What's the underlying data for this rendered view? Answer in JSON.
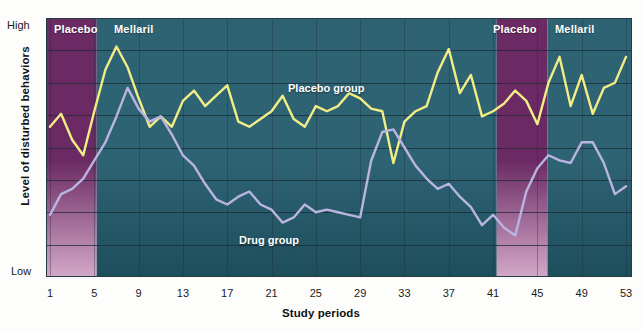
{
  "axes": {
    "y_title": "Level of disturbed behaviors",
    "y_high": "High",
    "y_low": "Low",
    "x_title": "Study periods"
  },
  "bands": [
    {
      "name": "Placebo",
      "label": "Placebo",
      "start": 1,
      "end": 5.5,
      "color": "#6b2a63"
    },
    {
      "name": "Mellaril",
      "label": "Mellaril",
      "start": 5.5,
      "end": 41,
      "color": "#2e6374"
    },
    {
      "name": "Placebo",
      "label": "Placebo",
      "start": 41,
      "end": 45.5,
      "color": "#6b2a63"
    },
    {
      "name": "Mellaril",
      "label": "Mellaril",
      "start": 45.5,
      "end": 53,
      "color": "#2e6374"
    }
  ],
  "series_labels": {
    "placebo": "Placebo group",
    "drug": "Drug group"
  },
  "colors": {
    "placebo_line": "#f2ed85",
    "drug_line": "#b9b4e0",
    "placebo_band": "#6b2a63",
    "placebo_band_bottom": "#d3a8c9",
    "mellaril_band": "#2e6374",
    "mellaril_band_bottom": "#1d4e5c",
    "gridline": "#1b2b33",
    "text": "#1a1a1a"
  },
  "xticks": [
    1,
    5,
    9,
    13,
    17,
    21,
    25,
    29,
    33,
    37,
    41,
    45,
    49,
    53
  ],
  "chart_data": {
    "type": "line",
    "title": "",
    "xlabel": "Study periods",
    "ylabel": "Level of disturbed behaviors",
    "ylim": [
      0,
      100
    ],
    "ytick_labels": [
      "Low",
      "High"
    ],
    "xlim": [
      1,
      53
    ],
    "grid": "horizontal-and-vertical",
    "legend": "inline-annotation",
    "gridlines_y": 7,
    "x": [
      1,
      2,
      3,
      4,
      5,
      6,
      7,
      8,
      9,
      10,
      11,
      12,
      13,
      14,
      15,
      16,
      17,
      18,
      19,
      20,
      21,
      22,
      23,
      24,
      25,
      26,
      27,
      28,
      29,
      30,
      31,
      32,
      33,
      34,
      35,
      36,
      37,
      38,
      39,
      40,
      41,
      42,
      43,
      44,
      45,
      46,
      47,
      48,
      49,
      50,
      51,
      52,
      53
    ],
    "series": [
      {
        "name": "Placebo group",
        "color": "#f2ed85",
        "values": [
          58,
          63,
          53,
          47,
          64,
          80,
          89,
          81,
          69,
          58,
          62,
          58,
          68,
          72,
          66,
          70,
          74,
          60,
          58,
          61,
          64,
          70,
          61,
          58,
          66,
          64,
          66,
          71,
          69,
          65,
          64,
          44,
          60,
          64,
          66,
          79,
          88,
          71,
          78,
          62,
          64,
          67,
          72,
          68,
          59,
          75,
          85,
          66,
          78,
          63,
          73,
          75,
          85
        ],
        "annotation": "Placebo group"
      },
      {
        "name": "Drug group",
        "color": "#b9b4e0",
        "values": [
          24,
          32,
          34,
          38,
          45,
          52,
          62,
          73,
          65,
          60,
          62,
          55,
          47,
          43,
          36,
          30,
          28,
          31,
          33,
          28,
          26,
          21,
          23,
          28,
          25,
          26,
          25,
          24,
          23,
          45,
          56,
          57,
          50,
          43,
          38,
          34,
          36,
          31,
          27,
          20,
          24,
          19,
          16,
          33,
          42,
          47,
          45,
          44,
          52,
          52,
          44,
          32,
          35
        ],
        "annotation": "Drug group"
      }
    ]
  }
}
